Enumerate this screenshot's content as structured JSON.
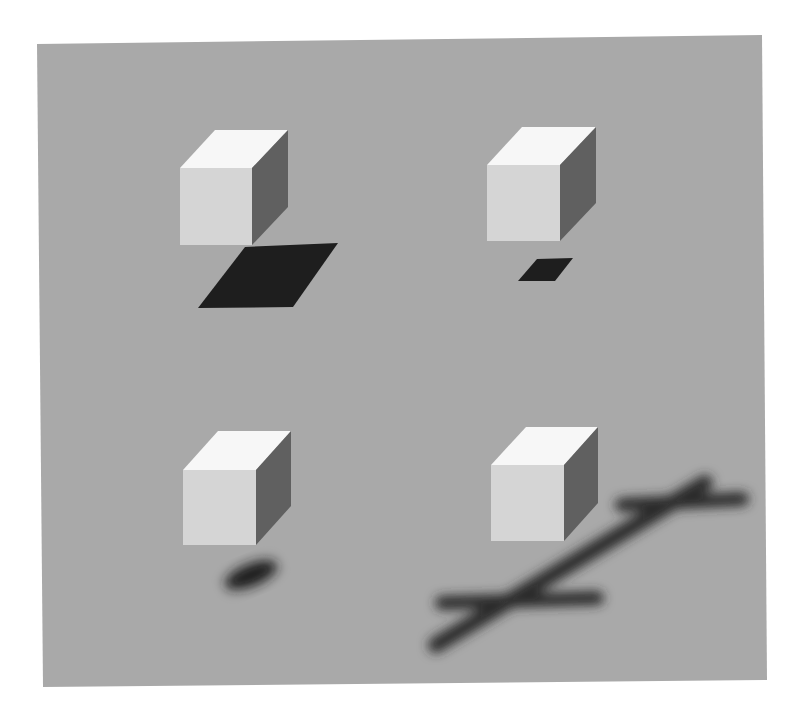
{
  "figure": {
    "colors": {
      "page_background": "#ffffff",
      "ground": "#a9a9a9",
      "cube_top": "#f7f7f7",
      "cube_front": "#d5d5d5",
      "cube_side": "#606060",
      "shadow": "#1e1e1e"
    },
    "panels": [
      {
        "id": "top-left",
        "shadow_type": "sharp-large-parallelogram"
      },
      {
        "id": "top-right",
        "shadow_type": "sharp-small-parallelogram"
      },
      {
        "id": "bottom-left",
        "shadow_type": "blurred-small-blob"
      },
      {
        "id": "bottom-right",
        "shadow_type": "blurred-elongated-stroke-shape"
      }
    ]
  }
}
